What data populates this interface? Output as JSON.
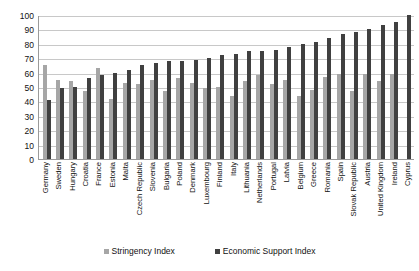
{
  "chart_data": {
    "type": "bar",
    "title": "",
    "subtitle": "",
    "xlabel": "",
    "ylabel": "",
    "ylim": [
      0,
      100
    ],
    "yticks": [
      0,
      10,
      20,
      30,
      40,
      50,
      60,
      70,
      80,
      90,
      100
    ],
    "grid": true,
    "legend_position": "bottom",
    "categories": [
      "Germany",
      "Sweden",
      "Hungary",
      "Croatia",
      "France",
      "Estonia",
      "Malta",
      "Czech Republic",
      "Slovenia",
      "Bulgaria",
      "Poland",
      "Denmark",
      "Luxembourg",
      "Finland",
      "Italy",
      "Lithuania",
      "Netherlands",
      "Portugal",
      "Latvia",
      "Belgium",
      "Greece",
      "Romania",
      "Spain",
      "Slovak Republic",
      "Austria",
      "United Kingdom",
      "Ireland",
      "Cyprus"
    ],
    "series": [
      {
        "name": "Stringency Index",
        "color": "#a6a6a6",
        "values": [
          65,
          55,
          54,
          47,
          63,
          42,
          53,
          52,
          55,
          47,
          56,
          53,
          49,
          50,
          44,
          54,
          58,
          52,
          55,
          44,
          48,
          57,
          59,
          47,
          59,
          54,
          59,
          0
        ]
      },
      {
        "name": "Economic Support Index",
        "color": "#404040",
        "values": [
          41,
          49,
          50,
          56,
          58,
          60,
          62,
          65,
          67,
          68,
          68,
          69,
          70,
          72,
          73,
          75,
          75,
          76,
          78,
          80,
          81,
          84,
          87,
          88,
          90,
          93,
          95,
          100
        ]
      }
    ]
  },
  "legend": {
    "items": [
      {
        "label": "Stringency Index",
        "color": "#a6a6a6"
      },
      {
        "label": "Economic Support Index",
        "color": "#404040"
      }
    ]
  }
}
